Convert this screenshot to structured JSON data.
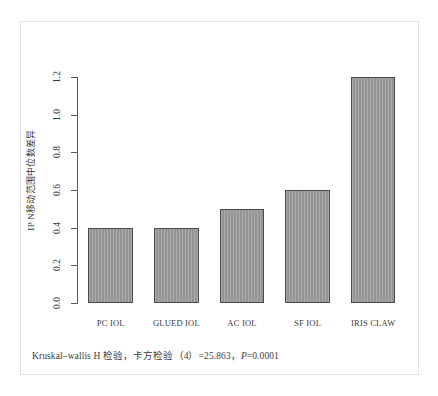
{
  "figure": {
    "y_axis_title": "IP N移动范围中位数差异",
    "caption": "Kruskal–wallis H 检验，卡方检验（4）=25.863，P=0.0001",
    "caption_parts": {
      "lead": "Kruskal–wallis H 检验，卡方检验（4）=25.863，",
      "p_italic": "P",
      "p_value": "=0.0001"
    },
    "frame_color": "#e3e3e3",
    "bar_fill": "#949494",
    "bar_border": "#4c4c4c",
    "axis_color": "#5a5a5a",
    "text_color": "#3b3b3b"
  },
  "chart_data": {
    "type": "bar",
    "title": "",
    "categories": [
      "PC IOL",
      "GLUED IOL",
      "AC IOL",
      "SF IOL",
      "IRIS CLAW"
    ],
    "values": [
      0.4,
      0.4,
      0.5,
      0.6,
      1.2
    ],
    "xlabel": "",
    "ylabel": "IP N移动范围中位数差异",
    "ylim": [
      0.0,
      1.2
    ],
    "yticks": [
      "0.0",
      "0.2",
      "0.4",
      "0.6",
      "0.8",
      "1.0",
      "1.2"
    ],
    "ytick_values": [
      0.0,
      0.2,
      0.4,
      0.6,
      0.8,
      1.0,
      1.2
    ],
    "grid": false,
    "legend": null,
    "annotation": "Kruskal–wallis H 检验，卡方检验（4）=25.863，P=0.0001"
  }
}
